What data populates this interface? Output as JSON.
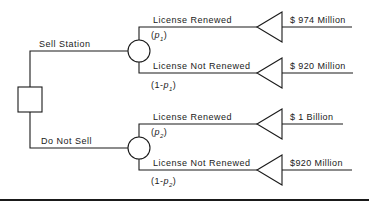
{
  "decision": {
    "options": [
      {
        "label": "Sell Station",
        "outcomes": [
          {
            "label": "License  Renewed",
            "prob_prefix": "(",
            "prob_var": "p",
            "prob_sub": "1",
            "prob_suffix": ")",
            "value": "$ 974 Million"
          },
          {
            "label": "License  Not  Renewed",
            "prob_prefix": "(1-",
            "prob_var": "p",
            "prob_sub": "1",
            "prob_suffix": ")",
            "value": "$ 920 Million"
          }
        ]
      },
      {
        "label": "Do Not Sell",
        "outcomes": [
          {
            "label": "License  Renewed",
            "prob_prefix": "(",
            "prob_var": "p",
            "prob_sub": "2",
            "prob_suffix": ")",
            "value": "$ 1 Billion"
          },
          {
            "label": "License  Not  Renewed",
            "prob_prefix": "(1-",
            "prob_var": "p",
            "prob_sub": "2",
            "prob_suffix": ")",
            "value": "$920 Million"
          }
        ]
      }
    ]
  },
  "colors": {
    "line": "#1a1a1a",
    "background": "#ffffff"
  }
}
